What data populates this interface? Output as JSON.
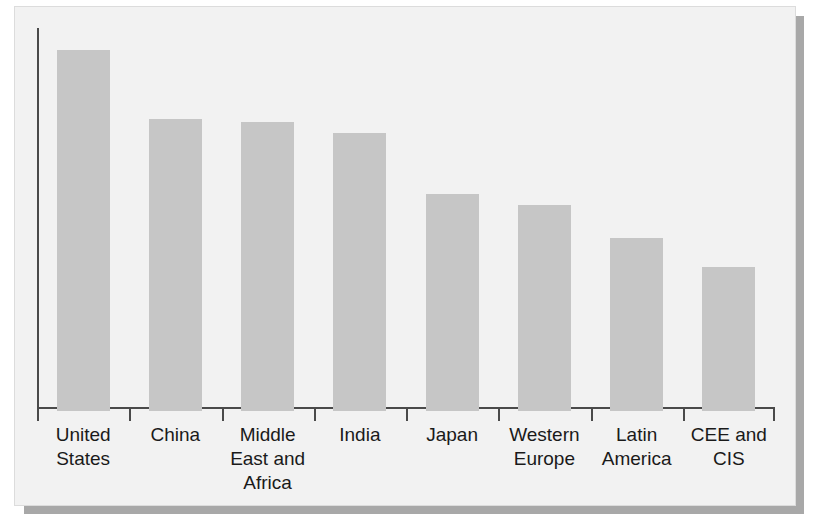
{
  "chart_data": {
    "type": "bar",
    "title": "",
    "subtitle": "",
    "xlabel": "",
    "ylabel": "",
    "categories": [
      "United States",
      "China",
      "Middle East and Africa",
      "India",
      "Japan",
      "Western Europe",
      "Latin America",
      "CEE and CIS"
    ],
    "category_label_lines": [
      "United\nStates",
      "China",
      "Middle\nEast and\nAfrica",
      "India",
      "Japan",
      "Western\nEurope",
      "Latin\nAmerica",
      "CEE and\nCIS"
    ],
    "values": [
      100,
      81,
      80,
      77,
      60,
      57,
      48,
      40
    ],
    "ylim": [
      0,
      105
    ],
    "grid": false,
    "legend": null,
    "axis_tick_labels": [],
    "y_tick_labels": [],
    "annotations": [],
    "series": [
      {
        "name": "",
        "values": [
          100,
          81,
          80,
          77,
          60,
          57,
          48,
          40
        ]
      }
    ]
  },
  "style": {
    "bar_color": "#c6c6c6",
    "axis_color": "#4a4a4a",
    "panel_background": "#f2f2f2",
    "page_background": "#ffffff",
    "shadow_color": "#a8a8a8",
    "label_color": "#1a1a1a"
  }
}
